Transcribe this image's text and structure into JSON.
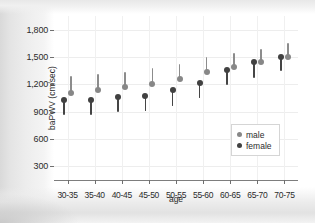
{
  "chart_data": {
    "type": "scatter",
    "title": "",
    "xlabel": "age",
    "ylabel": "baPWV (cm/sec)",
    "categories": [
      "30-35",
      "35-40",
      "40-45",
      "45-50",
      "50-55",
      "55-60",
      "60-65",
      "65-70",
      "70-75"
    ],
    "ylim": [
      150,
      1950
    ],
    "yticks": [
      300,
      600,
      900,
      1200,
      1500,
      1800
    ],
    "ytick_labels": [
      "300",
      "600",
      "900",
      "1,200",
      "1,500",
      "1,800"
    ],
    "grid": true,
    "legend_position": "center-right",
    "series": [
      {
        "name": "male",
        "color": "#878787",
        "values": [
          1110,
          1140,
          1175,
          1200,
          1255,
          1330,
          1385,
          1450,
          1500
        ],
        "err_low": [
          1110,
          1140,
          1175,
          1200,
          1255,
          1330,
          1385,
          1450,
          1500
        ],
        "err_high": [
          1290,
          1310,
          1340,
          1375,
          1420,
          1500,
          1545,
          1590,
          1650
        ]
      },
      {
        "name": "female",
        "color": "#414141",
        "values": [
          1025,
          1025,
          1060,
          1070,
          1135,
          1215,
          1360,
          1440,
          1500
        ],
        "err_low": [
          865,
          865,
          895,
          905,
          965,
          1050,
          1195,
          1270,
          1345
        ],
        "err_high": [
          1025,
          1025,
          1060,
          1070,
          1135,
          1215,
          1360,
          1440,
          1500
        ]
      }
    ]
  },
  "legend": {
    "items": [
      {
        "label": "male"
      },
      {
        "label": "female"
      }
    ]
  }
}
